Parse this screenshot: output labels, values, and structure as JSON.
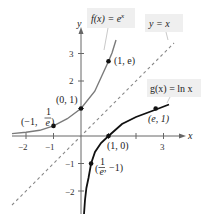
{
  "figure": {
    "axes": {
      "x_label": "x",
      "y_label": "y",
      "x_ticks": [
        "−2",
        "−1",
        "3"
      ],
      "y_ticks": [
        "3",
        "2",
        "−1",
        "−2"
      ]
    },
    "functions": [
      {
        "name": "f",
        "label": "f(x) = e^x",
        "label_main": "f(x) = e",
        "label_sup": "x",
        "color": "#7a7a7a"
      },
      {
        "name": "g",
        "label": "g(x) = ln x",
        "color": "#111111"
      },
      {
        "name": "identity",
        "label": "y = x",
        "color": "#8a8a8a",
        "style": "dashed"
      }
    ],
    "points": [
      {
        "label": "(1, e)",
        "x": 1,
        "y": 2.718
      },
      {
        "label": "(0, 1)",
        "x": 0,
        "y": 1
      },
      {
        "label": "(−1, 1/e)",
        "label_prefix": "(−1, ",
        "frac_num": "1",
        "frac_den": "e",
        "x": -1,
        "y": 0.368
      },
      {
        "label": "(1, 0)",
        "x": 1,
        "y": 0
      },
      {
        "label": "(e, 1)",
        "x": 2.718,
        "y": 1
      },
      {
        "label": "(1/e, −1)",
        "frac_num": "1",
        "frac_den": "e",
        "label_suffix": ", −1)",
        "x": 0.368,
        "y": -1
      }
    ],
    "label_boxes": {
      "f": "f(x) = e^x",
      "g": "g(x) = ln x",
      "identity": "y = x"
    }
  }
}
